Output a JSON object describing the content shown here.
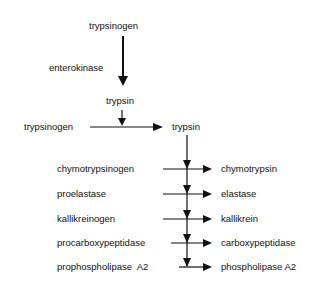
{
  "diagram": {
    "top": {
      "zymogen": "trypsinogen",
      "enzyme_label": "enterokinase",
      "product": "trypsin"
    },
    "autoactivation": {
      "zymogen": "trypsinogen",
      "product": "trypsin"
    },
    "conversions": [
      {
        "zymogen": "chymotrypsinogen",
        "product": "chymotrypsin"
      },
      {
        "zymogen": "proelastase",
        "product": "elastase"
      },
      {
        "zymogen": "kallikreinogen",
        "product": "kallikrein"
      },
      {
        "zymogen": "procarboxypeptidase",
        "product": "carboxypeptidase"
      },
      {
        "zymogen": "prophospholipase  A2",
        "product": "phospholipase A2"
      }
    ]
  }
}
